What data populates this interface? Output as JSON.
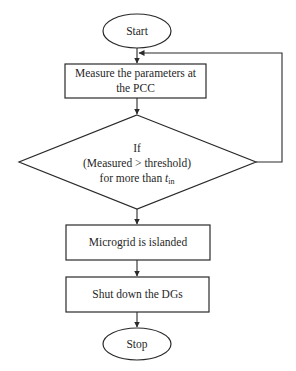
{
  "diagram": {
    "type": "flowchart",
    "nodes": {
      "start": {
        "shape": "ellipse",
        "label": "Start"
      },
      "measure": {
        "shape": "rectangle",
        "label_line1": "Measure the parameters at",
        "label_line2": "the PCC"
      },
      "decision": {
        "shape": "diamond",
        "label_line1": "If",
        "label_line2": "(Measured > threshold)",
        "label_line3_prefix": "for more than ",
        "label_var": "t",
        "label_sub": "in"
      },
      "islanded": {
        "shape": "rectangle",
        "label": "Microgrid is islanded"
      },
      "shutdown": {
        "shape": "rectangle",
        "label": "Shut down the DGs"
      },
      "stop": {
        "shape": "ellipse",
        "label": "Stop"
      }
    },
    "edges": [
      {
        "from": "start",
        "to": "measure"
      },
      {
        "from": "measure",
        "to": "decision"
      },
      {
        "from": "decision",
        "to": "measure",
        "note": "loop back from right vertex"
      },
      {
        "from": "decision",
        "to": "islanded"
      },
      {
        "from": "islanded",
        "to": "shutdown"
      },
      {
        "from": "shutdown",
        "to": "stop"
      }
    ],
    "colors": {
      "stroke": "#2a2a2a",
      "fill": "#ffffff",
      "text": "#1f1f1f"
    }
  }
}
